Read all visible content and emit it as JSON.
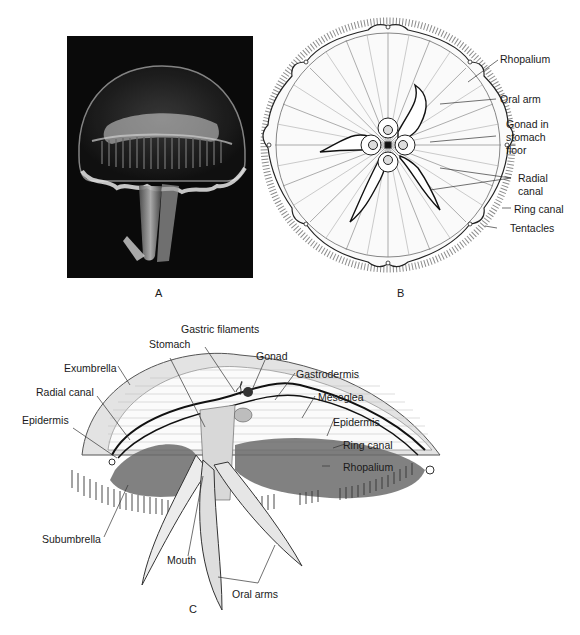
{
  "figure": {
    "panels": [
      {
        "id": "A",
        "letter": "A",
        "kind": "photograph",
        "subject": "moon jellyfish (Aurelia), side view"
      },
      {
        "id": "B",
        "letter": "B",
        "kind": "line drawing",
        "subject": "oral (underside) view",
        "labels": [
          "Rhopalium",
          "Oral arm",
          "Gonad in stomach floor",
          "Radial canal",
          "Ring canal",
          "Tentacles"
        ]
      },
      {
        "id": "C",
        "letter": "C",
        "kind": "cutaway drawing",
        "subject": "cross section",
        "labels": [
          "Gastric filaments",
          "Stomach",
          "Gonad",
          "Exumbrella",
          "Radial canal",
          "Gastrodermis",
          "Mesoglea",
          "Epidermis",
          "Epidermis",
          "Ring canal",
          "Rhopalium",
          "Subumbrella",
          "Mouth",
          "Oral arms"
        ]
      }
    ]
  },
  "panelA": {
    "letter": "A"
  },
  "panelB": {
    "letter": "B",
    "rhopalium": "Rhopalium",
    "oral_arm": "Oral arm",
    "gonad_line1": "Gonad in",
    "gonad_line2": "stomach",
    "gonad_line3": "floor",
    "radial_line1": "Radial",
    "radial_line2": "canal",
    "ring_canal": "Ring canal",
    "tentacles": "Tentacles"
  },
  "panelC": {
    "letter": "C",
    "gastric_filaments": "Gastric filaments",
    "stomach": "Stomach",
    "gonad": "Gonad",
    "exumbrella": "Exumbrella",
    "radial_canal": "Radial canal",
    "gastrodermis": "Gastrodermis",
    "mesoglea": "Mesoglea",
    "epidermis_left": "Epidermis",
    "epidermis_right": "Epidermis",
    "ring_canal": "Ring canal",
    "rhopalium": "Rhopalium",
    "subumbrella": "Subumbrella",
    "mouth": "Mouth",
    "oral_arms": "Oral arms"
  }
}
